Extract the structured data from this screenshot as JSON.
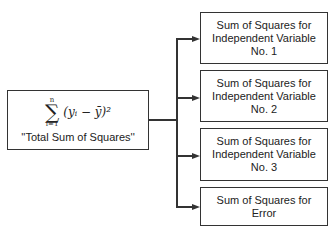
{
  "source": {
    "formula": {
      "sum_upper": "n",
      "sum_lower": "i=1",
      "sigma": "∑",
      "expression": "(yᵢ − ȳ)²"
    },
    "label": "''Total Sum of Squares''"
  },
  "targets": [
    {
      "lines": [
        "Sum of Squares for",
        "Independent Variable",
        "No. 1"
      ]
    },
    {
      "lines": [
        "Sum of Squares for",
        "Independent Variable",
        "No. 2"
      ]
    },
    {
      "lines": [
        "Sum of Squares for",
        "Independent Variable",
        "No. 3"
      ]
    },
    {
      "lines": [
        "Sum of Squares for",
        "Error"
      ]
    }
  ]
}
